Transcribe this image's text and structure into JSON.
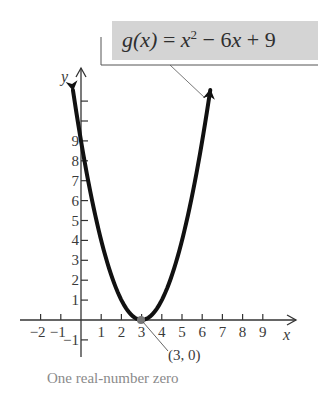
{
  "equation": {
    "fn": "g(x)",
    "rhs_parts": [
      "x",
      "2",
      " − 6",
      "x",
      " + 9"
    ],
    "full": "g(x) = x² − 6x + 9"
  },
  "point_label": "(3, 0)",
  "caption": "One real-number zero",
  "axes": {
    "x_label": "x",
    "y_label": "y"
  },
  "colors": {
    "curve": "#111111",
    "axis": "#333333",
    "label_box": "#d4d4d4",
    "caption": "#8a8a8a"
  },
  "chart_data": {
    "type": "line",
    "xlabel": "x",
    "ylabel": "y",
    "xlim": [
      -2.5,
      10.5
    ],
    "ylim": [
      -1.5,
      12
    ],
    "x_ticks": [
      -2,
      -1,
      1,
      2,
      3,
      4,
      5,
      6,
      7,
      8,
      9
    ],
    "x_tick_labels": [
      "−2",
      "−1",
      "1",
      "2",
      "3",
      "4",
      "5",
      "6",
      "7",
      "8",
      "9"
    ],
    "y_ticks": [
      -1,
      1,
      2,
      3,
      4,
      5,
      6,
      7,
      8,
      9,
      10,
      11
    ],
    "y_tick_labels": [
      "−1",
      "1",
      "2",
      "3",
      "4",
      "5",
      "6",
      "7",
      "8",
      "9",
      "",
      ""
    ],
    "grid": false,
    "series": [
      {
        "name": "g(x) = x^2 - 6x + 9",
        "x": [
          -0.4,
          0,
          0.5,
          1,
          1.5,
          2,
          2.5,
          3,
          3.5,
          4,
          4.5,
          5,
          5.5,
          6,
          6.4
        ],
        "y": [
          11.56,
          9,
          6.25,
          4,
          2.25,
          1,
          0.25,
          0,
          0.25,
          1,
          2.25,
          4,
          6.25,
          9,
          11.56
        ]
      }
    ],
    "annotations": [
      {
        "text": "(3, 0)",
        "x": 3,
        "y": 0,
        "type": "point"
      },
      {
        "text": "One real-number zero",
        "type": "caption"
      }
    ]
  }
}
